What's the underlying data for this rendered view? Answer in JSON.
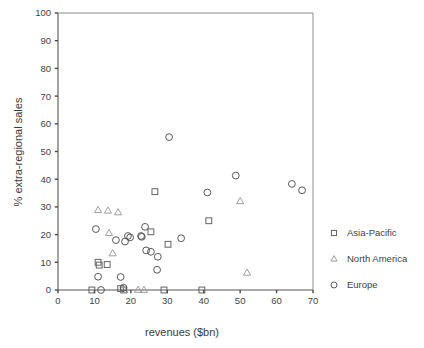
{
  "chart_data": {
    "type": "scatter",
    "title": "",
    "xlabel": "revenues ($bn)",
    "ylabel": "% extra-regional sales",
    "xlim": [
      0,
      70
    ],
    "ylim": [
      0,
      100
    ],
    "xticks": [
      0,
      10,
      20,
      30,
      40,
      50,
      60,
      70
    ],
    "yticks": [
      0,
      10,
      20,
      30,
      40,
      50,
      60,
      70,
      80,
      90,
      100
    ],
    "grid": false,
    "legend_position": "right",
    "series": [
      {
        "name": "Asia-Pacific",
        "marker": "square",
        "color": "#5d5d5d",
        "points": [
          [
            9.3,
            0.0
          ],
          [
            11.0,
            10.0
          ],
          [
            11.3,
            9.0
          ],
          [
            13.5,
            9.2
          ],
          [
            17.2,
            0.5
          ],
          [
            18.0,
            0.0
          ],
          [
            25.5,
            21.0
          ],
          [
            26.6,
            35.5
          ],
          [
            29.1,
            0.0
          ],
          [
            30.2,
            16.5
          ],
          [
            39.5,
            0.0
          ],
          [
            41.4,
            25.0
          ]
        ]
      },
      {
        "name": "North America",
        "marker": "triangle",
        "color": "#9a9a9a",
        "points": [
          [
            11.0,
            28.8
          ],
          [
            13.7,
            28.6
          ],
          [
            16.5,
            28.0
          ],
          [
            14.0,
            20.5
          ],
          [
            15.0,
            13.2
          ],
          [
            18.2,
            0.0
          ],
          [
            22.0,
            0.0
          ],
          [
            23.6,
            0.0
          ],
          [
            50.0,
            32.0
          ],
          [
            51.9,
            6.2
          ]
        ]
      },
      {
        "name": "Europe",
        "marker": "circle",
        "color": "#4f4f4f",
        "points": [
          [
            10.4,
            22.0
          ],
          [
            11.0,
            4.8
          ],
          [
            11.8,
            0.0
          ],
          [
            15.9,
            18.0
          ],
          [
            17.2,
            4.7
          ],
          [
            18.4,
            17.5
          ],
          [
            19.2,
            19.5
          ],
          [
            19.8,
            19.0
          ],
          [
            18.0,
            0.8
          ],
          [
            22.8,
            19.5
          ],
          [
            23.0,
            19.2
          ],
          [
            23.9,
            22.8
          ],
          [
            24.2,
            14.3
          ],
          [
            25.5,
            13.8
          ],
          [
            27.4,
            12.0
          ],
          [
            27.2,
            7.3
          ],
          [
            30.5,
            55.2
          ],
          [
            33.8,
            18.7
          ],
          [
            41.0,
            35.2
          ],
          [
            48.8,
            41.3
          ],
          [
            64.2,
            38.3
          ],
          [
            67.0,
            36.0
          ]
        ]
      }
    ]
  },
  "legend": {
    "items": [
      {
        "label": "Asia-Pacific",
        "marker": "square"
      },
      {
        "label": "North America",
        "marker": "triangle"
      },
      {
        "label": "Europe",
        "marker": "circle"
      }
    ]
  }
}
